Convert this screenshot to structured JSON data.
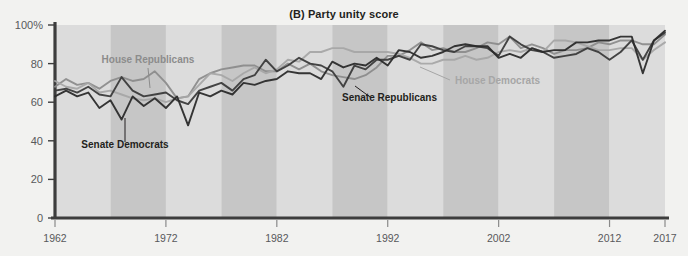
{
  "chart_data": {
    "type": "line",
    "title": "(B) Party unity score",
    "xlabel": "",
    "ylabel": "",
    "xlim": [
      1962,
      2017
    ],
    "ylim": [
      0,
      100
    ],
    "grid": false,
    "legend_position": "inline-annotations",
    "ytick_labels": [
      "0",
      "20",
      "40",
      "60",
      "80",
      "100%"
    ],
    "ytick_values": [
      0,
      20,
      40,
      60,
      80,
      100
    ],
    "xtick_labels": [
      "1962",
      "1972",
      "1982",
      "1992",
      "2002",
      "2012",
      "2017"
    ],
    "xtick_values": [
      1962,
      1972,
      1982,
      1992,
      2002,
      2012,
      2017
    ],
    "x": [
      1962,
      1963,
      1964,
      1965,
      1966,
      1967,
      1968,
      1969,
      1970,
      1971,
      1972,
      1973,
      1974,
      1975,
      1976,
      1977,
      1978,
      1979,
      1980,
      1981,
      1982,
      1983,
      1984,
      1985,
      1986,
      1987,
      1988,
      1989,
      1990,
      1991,
      1992,
      1993,
      1994,
      1995,
      1996,
      1997,
      1998,
      1999,
      2000,
      2001,
      2002,
      2003,
      2004,
      2005,
      2006,
      2007,
      2008,
      2009,
      2010,
      2011,
      2012,
      2013,
      2014,
      2015,
      2016,
      2017
    ],
    "series": [
      {
        "name": "House Republicans",
        "color": "#8c8c8c",
        "values": [
          68,
          72,
          69,
          70,
          67,
          71,
          73,
          71,
          72,
          76,
          70,
          62,
          63,
          72,
          75,
          77,
          78,
          79,
          79,
          76,
          76,
          80,
          77,
          80,
          76,
          74,
          73,
          72,
          74,
          78,
          84,
          84,
          87,
          91,
          87,
          88,
          86,
          86,
          88,
          91,
          90,
          94,
          88,
          90,
          88,
          85,
          87,
          87,
          88,
          91,
          90,
          92,
          92,
          90,
          90,
          95
        ]
      },
      {
        "name": "House Democrats",
        "color": "#a6a6a6",
        "values": [
          71,
          68,
          67,
          70,
          65,
          66,
          64,
          62,
          61,
          62,
          60,
          62,
          63,
          69,
          75,
          74,
          71,
          75,
          78,
          75,
          77,
          82,
          81,
          86,
          86,
          88,
          88,
          86,
          86,
          86,
          86,
          85,
          83,
          80,
          80,
          82,
          82,
          84,
          82,
          83,
          86,
          87,
          86,
          88,
          86,
          92,
          92,
          91,
          89,
          87,
          87,
          88,
          88,
          82,
          87,
          91
        ]
      },
      {
        "name": "Senate Republicans",
        "color": "#3b3b3b",
        "values": [
          66,
          67,
          65,
          68,
          64,
          63,
          73,
          66,
          63,
          64,
          65,
          61,
          59,
          66,
          68,
          70,
          66,
          72,
          74,
          82,
          76,
          79,
          83,
          80,
          79,
          76,
          68,
          79,
          77,
          82,
          82,
          84,
          82,
          90,
          89,
          87,
          86,
          89,
          89,
          88,
          84,
          94,
          90,
          87,
          86,
          83,
          84,
          85,
          88,
          86,
          82,
          86,
          92,
          82,
          92,
          96
        ]
      },
      {
        "name": "Senate Democrats",
        "color": "#2b2b2b",
        "values": [
          63,
          66,
          63,
          65,
          57,
          61,
          51,
          63,
          58,
          62,
          57,
          63,
          48,
          65,
          63,
          66,
          64,
          70,
          69,
          71,
          72,
          76,
          75,
          75,
          72,
          81,
          78,
          80,
          79,
          83,
          79,
          87,
          86,
          83,
          84,
          86,
          89,
          90,
          89,
          89,
          83,
          85,
          83,
          88,
          86,
          87,
          87,
          91,
          91,
          92,
          92,
          94,
          94,
          75,
          92,
          97
        ]
      }
    ],
    "annotations": [
      {
        "text": "House Republicans",
        "color": "#8c8c8c"
      },
      {
        "text": "House Democrats",
        "color": "#a6a6a6"
      },
      {
        "text": "Senate Republicans",
        "color": "#231f20"
      },
      {
        "text": "Senate Democrats",
        "color": "#231f20"
      }
    ],
    "band_colors": {
      "light": "#dcdcdc",
      "dark": "#c6c6c6"
    },
    "plot_background": "#dcdcdc",
    "page_background": "#f2f2f0",
    "axis_color": "#3d3d3d"
  }
}
